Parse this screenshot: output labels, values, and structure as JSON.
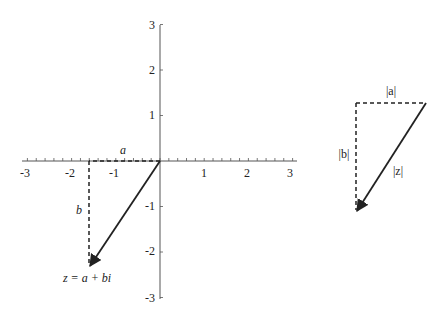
{
  "plane": {
    "x_ticks": [
      "-3",
      "-2",
      "-1",
      "1",
      "2",
      "3"
    ],
    "y_ticks": [
      "3",
      "2",
      "1",
      "-1",
      "-2",
      "-3"
    ],
    "x_range": [
      -3,
      3
    ],
    "y_range": [
      -3,
      3
    ],
    "point": {
      "a": -1.6,
      "b": -2.35
    },
    "label_a": "a",
    "label_b": "b",
    "label_z": "z = a + bi"
  },
  "triangle": {
    "label_a": "|a|",
    "label_b": "|b|",
    "label_z": "|z|"
  },
  "colors": {
    "line": "#222222",
    "axis": "#555555"
  }
}
